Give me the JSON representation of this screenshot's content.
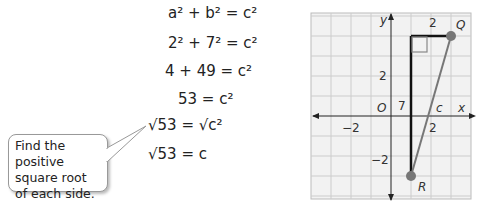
{
  "equations": [
    {
      "lhs": "a² + b²",
      "rhs": "c²"
    },
    {
      "lhs": "2² + 7²",
      "rhs": "c²"
    },
    {
      "lhs": "4 + 49",
      "rhs": "c²"
    },
    {
      "lhs": "53",
      "rhs": "c²"
    },
    {
      "lhs": "√53",
      "rhs": "√c²"
    },
    {
      "lhs": "√53",
      "rhs": "c"
    }
  ],
  "callout": {
    "text": "Find the positive square root of each side."
  },
  "graph": {
    "x_label": "x",
    "y_label": "y",
    "origin_label": "O",
    "ticks": {
      "x_neg": "−2",
      "x_pos": "2",
      "y_pos": "2",
      "y_neg": "−2"
    },
    "points": {
      "Q": "Q",
      "R": "R"
    },
    "side_labels": {
      "horizontal": "2",
      "vertical": "7",
      "hyp": "c"
    }
  }
}
